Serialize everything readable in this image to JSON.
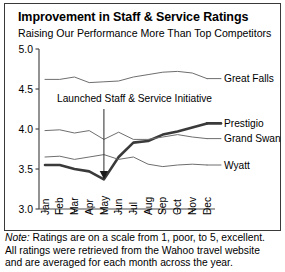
{
  "chart_data": {
    "type": "line",
    "title": "Improvement in Staff & Service Ratings",
    "subtitle": "Raising Our Performance More Than Top Competitors",
    "xlabel": "",
    "ylabel": "",
    "ylim": [
      3.0,
      5.0
    ],
    "yticks": [
      3.0,
      3.5,
      4.0,
      4.5,
      5.0
    ],
    "ytick_labels": [
      "3.0",
      "3.5",
      "4.0",
      "4.5",
      "5.0"
    ],
    "grid": false,
    "legend_position": "right-inline",
    "categories": [
      "Jan",
      "Feb",
      "Mar",
      "Apr",
      "May",
      "Jun",
      "Jul",
      "Aug",
      "Sep",
      "Oct",
      "Nov",
      "Dec"
    ],
    "series": [
      {
        "name": "Great Falls",
        "emphasis": false,
        "color": "#6e6e6e",
        "values": [
          4.62,
          4.62,
          4.65,
          4.58,
          4.59,
          4.6,
          4.65,
          4.68,
          4.71,
          4.72,
          4.7,
          4.63
        ]
      },
      {
        "name": "Prestigio",
        "emphasis": true,
        "color": "#3a3a3a",
        "values": [
          3.55,
          3.55,
          3.5,
          3.47,
          3.37,
          3.65,
          3.83,
          3.85,
          3.93,
          3.97,
          4.02,
          4.07
        ]
      },
      {
        "name": "Grand Swan",
        "emphasis": false,
        "color": "#6e6e6e",
        "values": [
          3.98,
          3.99,
          3.95,
          3.98,
          3.87,
          3.96,
          3.87,
          3.87,
          3.9,
          3.93,
          3.9,
          3.88
        ]
      },
      {
        "name": "Wyatt",
        "emphasis": false,
        "color": "#6e6e6e",
        "values": [
          3.65,
          3.66,
          3.62,
          3.65,
          3.68,
          3.62,
          3.65,
          3.56,
          3.53,
          3.55,
          3.56,
          3.55
        ]
      }
    ],
    "annotations": [
      {
        "text": "Launched Staff & Service Initiative",
        "points_to_category": "May",
        "points_to_value": 3.37
      }
    ],
    "footnote": {
      "note_word": "Note:",
      "line1": " Ratings are on a scale from 1, poor, to 5, excellent.",
      "line2": "All ratings were retrieved from the Wahoo travel website",
      "line3": "and are averaged for each month across the year."
    }
  }
}
